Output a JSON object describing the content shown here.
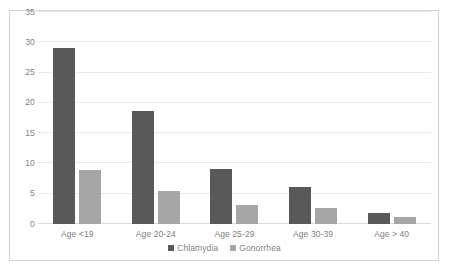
{
  "chart_data": {
    "type": "bar",
    "title": "",
    "xlabel": "",
    "ylabel": "",
    "categories": [
      "Age <19",
      "Age 20-24",
      "Age 25-29",
      "Age 30-39",
      "Age > 40"
    ],
    "series": [
      {
        "name": "Chlamydia",
        "color": "#595959",
        "values": [
          29,
          18.6,
          9.1,
          6.1,
          1.8
        ]
      },
      {
        "name": "Gonorrhea",
        "color": "#a6a6a6",
        "values": [
          9,
          5.5,
          3.1,
          2.6,
          1.2
        ]
      }
    ],
    "ylim": [
      0,
      35
    ],
    "yticks": [
      0,
      5,
      10,
      15,
      20,
      25,
      30,
      35
    ],
    "ytick_labels": [
      "0",
      "5",
      "10",
      "15",
      "20",
      "25",
      "30",
      "35"
    ],
    "grid": true,
    "legend_position": "bottom",
    "border_color": "#d4d4d4",
    "gridline_color": "#e8e8e8",
    "text_color": "#7f7f7f"
  }
}
